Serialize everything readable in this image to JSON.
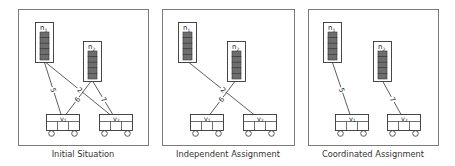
{
  "colors": {
    "frame": "#7a7a7a",
    "stroke": "#333333",
    "cell_fill": "#6e6e6e",
    "text": "#222222"
  },
  "panels": [
    {
      "id": "initial",
      "caption": "Initial Situation",
      "frame": {
        "x": 18,
        "y": 9,
        "w": 130,
        "h": 136
      },
      "nodes": [
        {
          "id": "n1",
          "label": "n",
          "sub": "1",
          "x": 35,
          "y": 22,
          "w": 18,
          "h": 40
        },
        {
          "id": "n2",
          "label": "n",
          "sub": "2",
          "x": 83,
          "y": 41,
          "w": 18,
          "h": 40
        }
      ],
      "vehicles": [
        {
          "id": "v1",
          "label": "v",
          "sub": "1",
          "x": 46,
          "y": 114,
          "w": 33,
          "h": 16
        },
        {
          "id": "v2",
          "label": "v",
          "sub": "2",
          "x": 99,
          "y": 114,
          "w": 33,
          "h": 16
        }
      ],
      "edges": [
        {
          "from": "n1",
          "to": "v1",
          "label": "5"
        },
        {
          "from": "n1",
          "to": "v2",
          "label": "2"
        },
        {
          "from": "n2",
          "to": "v1",
          "label": "6"
        },
        {
          "from": "n2",
          "to": "v2",
          "label": "7"
        }
      ]
    },
    {
      "id": "independent",
      "caption": "Independent Assignment",
      "frame": {
        "x": 162,
        "y": 9,
        "w": 132,
        "h": 136
      },
      "nodes": [
        {
          "id": "n1",
          "label": "n",
          "sub": "1",
          "x": 178,
          "y": 22,
          "w": 18,
          "h": 40
        },
        {
          "id": "n2",
          "label": "n",
          "sub": "2",
          "x": 227,
          "y": 41,
          "w": 18,
          "h": 40
        }
      ],
      "vehicles": [
        {
          "id": "v1",
          "label": "v",
          "sub": "1",
          "x": 190,
          "y": 114,
          "w": 33,
          "h": 16
        },
        {
          "id": "v2",
          "label": "v",
          "sub": "2",
          "x": 243,
          "y": 114,
          "w": 33,
          "h": 16
        }
      ],
      "edges": [
        {
          "from": "n1",
          "to": "v2",
          "label": "2"
        },
        {
          "from": "n2",
          "to": "v1",
          "label": "6"
        }
      ]
    },
    {
      "id": "coordinated",
      "caption": "Coordinated Assignment",
      "frame": {
        "x": 308,
        "y": 9,
        "w": 130,
        "h": 136
      },
      "nodes": [
        {
          "id": "n1",
          "label": "n",
          "sub": "1",
          "x": 323,
          "y": 22,
          "w": 18,
          "h": 40
        },
        {
          "id": "n2",
          "label": "n",
          "sub": "2",
          "x": 373,
          "y": 41,
          "w": 18,
          "h": 40
        }
      ],
      "vehicles": [
        {
          "id": "v1",
          "label": "v",
          "sub": "1",
          "x": 335,
          "y": 114,
          "w": 33,
          "h": 16
        },
        {
          "id": "v2",
          "label": "v",
          "sub": "2",
          "x": 387,
          "y": 114,
          "w": 33,
          "h": 16
        }
      ],
      "edges": [
        {
          "from": "n1",
          "to": "v1",
          "label": "5"
        },
        {
          "from": "n2",
          "to": "v2",
          "label": "7"
        }
      ]
    }
  ]
}
